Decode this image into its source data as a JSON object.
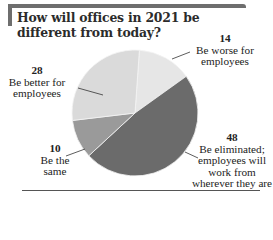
{
  "chart_data": {
    "type": "pie",
    "title": "How will offices in 2021 be different from today?",
    "categories": [
      "Be worse for employees",
      "Be eliminated; employees will work from wherever they are",
      "Be the same",
      "Be better for employees"
    ],
    "values": [
      14,
      48,
      10,
      28
    ],
    "unit": "%",
    "colors": [
      "#e6e6e6",
      "#6b6b6b",
      "#9a9a9a",
      "#dadada"
    ],
    "legend": "none (direct labels)"
  },
  "title": "How will offices in 2021 be different from today?",
  "labels": {
    "worse": {
      "value": "14",
      "text": "Be worse for employees"
    },
    "eliminated": {
      "value": "48",
      "text": "Be eliminated; employees will work from wherever they are"
    },
    "same": {
      "value": "10",
      "text": "Be the same"
    },
    "better": {
      "value": "28",
      "text": "Be better for employees"
    }
  }
}
